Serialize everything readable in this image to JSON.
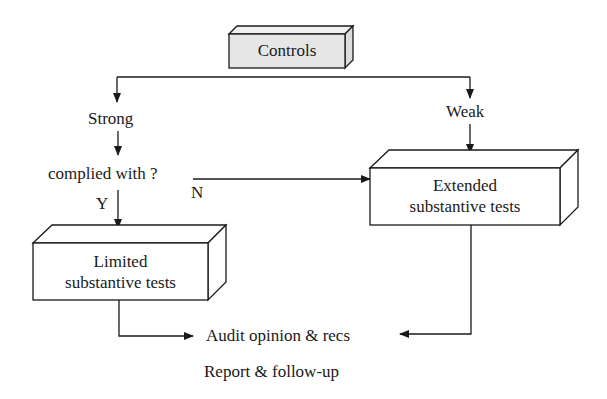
{
  "diagram": {
    "type": "flowchart",
    "nodes": {
      "controls": {
        "label": "Controls",
        "fill": "#e6e6e6"
      },
      "strong": {
        "label": "Strong"
      },
      "weak": {
        "label": "Weak"
      },
      "complied": {
        "label": "complied with ?"
      },
      "yes": {
        "label": "Y"
      },
      "no": {
        "label": "N"
      },
      "limited": {
        "line1": "Limited",
        "line2": "substantive tests",
        "fill": "#ffffff"
      },
      "extended": {
        "line1": "Extended",
        "line2": "substantive tests",
        "fill": "#ffffff"
      },
      "audit": {
        "label": "Audit opinion & recs"
      },
      "report": {
        "label": "Report &  follow-up"
      }
    },
    "edges": [
      {
        "from": "controls",
        "to": "strong"
      },
      {
        "from": "controls",
        "to": "weak"
      },
      {
        "from": "strong",
        "to": "complied"
      },
      {
        "from": "complied",
        "to": "limited",
        "label": "Y"
      },
      {
        "from": "complied",
        "to": "extended",
        "label": "N"
      },
      {
        "from": "weak",
        "to": "extended"
      },
      {
        "from": "limited",
        "to": "audit"
      },
      {
        "from": "extended",
        "to": "audit"
      }
    ],
    "colors": {
      "line": "#1a1a1a",
      "controls_fill": "#e6e6e6",
      "box_fill": "#ffffff"
    }
  }
}
